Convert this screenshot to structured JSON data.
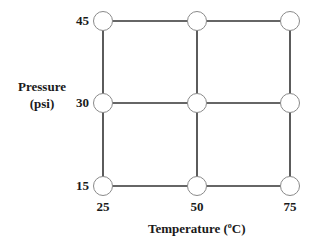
{
  "diagram": {
    "title": "",
    "x_axis": {
      "label_prefix": "Temperature (",
      "label_sup": "o",
      "label_suffix": "C)",
      "ticks": [
        "25",
        "50",
        "75"
      ]
    },
    "y_axis": {
      "label_line1": "Pressure",
      "label_line2": "(psi)",
      "ticks": [
        "45",
        "30",
        "15"
      ]
    },
    "grid": {
      "columns": 3,
      "rows": 3,
      "node_count": 9,
      "node_fill": "#ffffff",
      "node_stroke": "#888888",
      "line_color": "#333333"
    },
    "nodes": [
      {
        "temperature": 25,
        "pressure": 45
      },
      {
        "temperature": 50,
        "pressure": 45
      },
      {
        "temperature": 75,
        "pressure": 45
      },
      {
        "temperature": 25,
        "pressure": 30
      },
      {
        "temperature": 50,
        "pressure": 30
      },
      {
        "temperature": 75,
        "pressure": 30
      },
      {
        "temperature": 25,
        "pressure": 15
      },
      {
        "temperature": 50,
        "pressure": 15
      },
      {
        "temperature": 75,
        "pressure": 15
      }
    ]
  }
}
